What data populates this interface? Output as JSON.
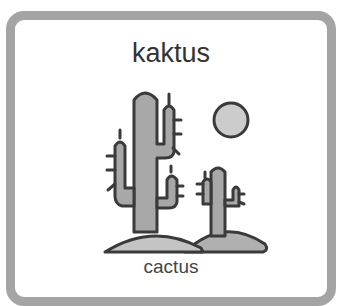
{
  "card": {
    "title": "kaktus",
    "caption": "cactus",
    "icon": "cactus-desert-icon",
    "colors": {
      "border": "#a4a4a4",
      "fill": "#a8a8a8",
      "outline": "#3a3a3a",
      "sun": "#cccccc"
    }
  }
}
